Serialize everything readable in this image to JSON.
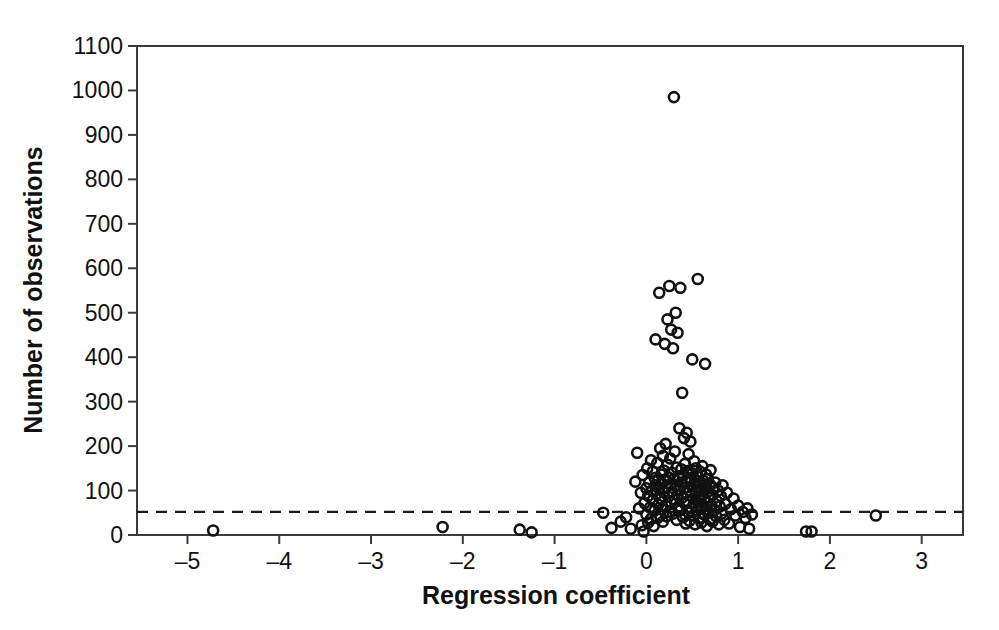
{
  "chart_data": {
    "type": "scatter",
    "title": "",
    "xlabel": "Regression coefficient",
    "ylabel": "Number of observations",
    "xlim": [
      -5.55,
      3.45
    ],
    "ylim": [
      0,
      1100
    ],
    "xticks": [
      -5,
      -4,
      -3,
      -2,
      -1,
      0,
      1,
      2,
      3
    ],
    "xtick_labels": [
      "–5",
      "–4",
      "–3",
      "–2",
      "–1",
      "0",
      "1",
      "2",
      "3"
    ],
    "yticks": [
      0,
      100,
      200,
      300,
      400,
      500,
      600,
      700,
      800,
      900,
      1000,
      1100
    ],
    "ytick_labels": [
      "0",
      "100",
      "200",
      "300",
      "400",
      "500",
      "600",
      "700",
      "800",
      "900",
      "1000",
      "1100"
    ],
    "grid": false,
    "legend": null,
    "marker": {
      "shape": "open-circle",
      "radius_px": 5,
      "edge_color": "#111111",
      "fill": "none"
    },
    "annotations": [
      {
        "kind": "horizontal-dashed-line",
        "y": 52,
        "label": "",
        "color": "#1a1a1a",
        "dash": "dashed"
      }
    ],
    "points": [
      [
        -4.72,
        10
      ],
      [
        -2.22,
        18
      ],
      [
        -1.38,
        12
      ],
      [
        -1.25,
        6
      ],
      [
        -0.47,
        50
      ],
      [
        -0.38,
        16
      ],
      [
        -0.28,
        30
      ],
      [
        -0.22,
        40
      ],
      [
        -0.17,
        14
      ],
      [
        -0.12,
        120
      ],
      [
        -0.1,
        185
      ],
      [
        -0.08,
        60
      ],
      [
        -0.06,
        95
      ],
      [
        -0.05,
        22
      ],
      [
        -0.04,
        135
      ],
      [
        -0.03,
        8
      ],
      [
        -0.02,
        72
      ],
      [
        0.0,
        105
      ],
      [
        0.0,
        46
      ],
      [
        0.01,
        150
      ],
      [
        0.02,
        88
      ],
      [
        0.02,
        28
      ],
      [
        0.03,
        118
      ],
      [
        0.04,
        62
      ],
      [
        0.05,
        168
      ],
      [
        0.05,
        36
      ],
      [
        0.06,
        100
      ],
      [
        0.07,
        78
      ],
      [
        0.07,
        143
      ],
      [
        0.08,
        20
      ],
      [
        0.09,
        128
      ],
      [
        0.09,
        55
      ],
      [
        0.1,
        112
      ],
      [
        0.1,
        440
      ],
      [
        0.11,
        92
      ],
      [
        0.12,
        162
      ],
      [
        0.12,
        38
      ],
      [
        0.13,
        124
      ],
      [
        0.13,
        68
      ],
      [
        0.14,
        545
      ],
      [
        0.14,
        104
      ],
      [
        0.15,
        195
      ],
      [
        0.15,
        44
      ],
      [
        0.16,
        136
      ],
      [
        0.16,
        82
      ],
      [
        0.17,
        116
      ],
      [
        0.17,
        58
      ],
      [
        0.18,
        178
      ],
      [
        0.18,
        30
      ],
      [
        0.19,
        145
      ],
      [
        0.19,
        96
      ],
      [
        0.2,
        430
      ],
      [
        0.2,
        122
      ],
      [
        0.21,
        66
      ],
      [
        0.21,
        205
      ],
      [
        0.22,
        108
      ],
      [
        0.22,
        42
      ],
      [
        0.23,
        485
      ],
      [
        0.23,
        158
      ],
      [
        0.24,
        86
      ],
      [
        0.24,
        130
      ],
      [
        0.25,
        560
      ],
      [
        0.25,
        52
      ],
      [
        0.26,
        114
      ],
      [
        0.26,
        172
      ],
      [
        0.27,
        462
      ],
      [
        0.27,
        74
      ],
      [
        0.28,
        140
      ],
      [
        0.28,
        98
      ],
      [
        0.29,
        420
      ],
      [
        0.29,
        48
      ],
      [
        0.3,
        985
      ],
      [
        0.3,
        126
      ],
      [
        0.31,
        188
      ],
      [
        0.31,
        80
      ],
      [
        0.32,
        500
      ],
      [
        0.32,
        110
      ],
      [
        0.33,
        34
      ],
      [
        0.33,
        152
      ],
      [
        0.34,
        455
      ],
      [
        0.34,
        90
      ],
      [
        0.35,
        132
      ],
      [
        0.35,
        64
      ],
      [
        0.36,
        240
      ],
      [
        0.36,
        102
      ],
      [
        0.37,
        556
      ],
      [
        0.37,
        56
      ],
      [
        0.38,
        148
      ],
      [
        0.38,
        118
      ],
      [
        0.39,
        320
      ],
      [
        0.39,
        84
      ],
      [
        0.4,
        134
      ],
      [
        0.4,
        40
      ],
      [
        0.41,
        218
      ],
      [
        0.41,
        106
      ],
      [
        0.42,
        70
      ],
      [
        0.42,
        160
      ],
      [
        0.43,
        94
      ],
      [
        0.43,
        26
      ],
      [
        0.44,
        230
      ],
      [
        0.44,
        120
      ],
      [
        0.45,
        76
      ],
      [
        0.45,
        144
      ],
      [
        0.46,
        50
      ],
      [
        0.46,
        182
      ],
      [
        0.47,
        100
      ],
      [
        0.47,
        32
      ],
      [
        0.48,
        128
      ],
      [
        0.48,
        210
      ],
      [
        0.49,
        60
      ],
      [
        0.49,
        88
      ],
      [
        0.5,
        395
      ],
      [
        0.5,
        138
      ],
      [
        0.51,
        44
      ],
      [
        0.51,
        112
      ],
      [
        0.52,
        166
      ],
      [
        0.52,
        72
      ],
      [
        0.53,
        124
      ],
      [
        0.53,
        24
      ],
      [
        0.54,
        96
      ],
      [
        0.54,
        150
      ],
      [
        0.55,
        54
      ],
      [
        0.55,
        108
      ],
      [
        0.56,
        576
      ],
      [
        0.56,
        132
      ],
      [
        0.57,
        68
      ],
      [
        0.57,
        86
      ],
      [
        0.58,
        116
      ],
      [
        0.58,
        38
      ],
      [
        0.59,
        142
      ],
      [
        0.59,
        78
      ],
      [
        0.6,
        104
      ],
      [
        0.6,
        28
      ],
      [
        0.61,
        155
      ],
      [
        0.61,
        62
      ],
      [
        0.62,
        92
      ],
      [
        0.62,
        122
      ],
      [
        0.63,
        46
      ],
      [
        0.63,
        80
      ],
      [
        0.64,
        385
      ],
      [
        0.64,
        110
      ],
      [
        0.65,
        58
      ],
      [
        0.65,
        136
      ],
      [
        0.66,
        74
      ],
      [
        0.66,
        20
      ],
      [
        0.67,
        98
      ],
      [
        0.67,
        126
      ],
      [
        0.68,
        52
      ],
      [
        0.68,
        84
      ],
      [
        0.69,
        114
      ],
      [
        0.7,
        36
      ],
      [
        0.7,
        146
      ],
      [
        0.71,
        66
      ],
      [
        0.72,
        90
      ],
      [
        0.72,
        30
      ],
      [
        0.73,
        106
      ],
      [
        0.74,
        56
      ],
      [
        0.75,
        118
      ],
      [
        0.76,
        42
      ],
      [
        0.77,
        76
      ],
      [
        0.78,
        100
      ],
      [
        0.79,
        24
      ],
      [
        0.8,
        64
      ],
      [
        0.81,
        88
      ],
      [
        0.82,
        48
      ],
      [
        0.83,
        112
      ],
      [
        0.85,
        34
      ],
      [
        0.86,
        70
      ],
      [
        0.88,
        95
      ],
      [
        0.9,
        26
      ],
      [
        0.92,
        58
      ],
      [
        0.95,
        82
      ],
      [
        0.97,
        44
      ],
      [
        1.0,
        66
      ],
      [
        1.02,
        18
      ],
      [
        1.05,
        52
      ],
      [
        1.08,
        38
      ],
      [
        1.1,
        60
      ],
      [
        1.12,
        14
      ],
      [
        1.15,
        46
      ],
      [
        1.74,
        8
      ],
      [
        1.8,
        8
      ],
      [
        2.5,
        44
      ]
    ]
  },
  "figure": {
    "background_color": "#ffffff",
    "axis_color": "#3b3b3b",
    "marker_color": "#111111",
    "threshold_color": "#1a1a1a"
  }
}
